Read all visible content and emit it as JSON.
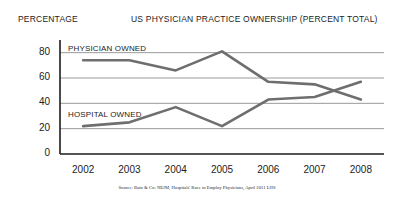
{
  "header": {
    "axis_label": "PERCENTAGE",
    "title": "US PHYSICIAN PRACTICE OWNERSHIP (PERCENT TOTAL)"
  },
  "source_note": "Source: Bain & Co; NEJM, Hospitals' Race to Employ Physicians, April 2011 LHS",
  "colors": {
    "line": "#6e6e6e",
    "gridline": "#9a9a9a",
    "axis": "#1c1c1c",
    "text": "#1c1c1c",
    "background": "#ffffff"
  },
  "chart_data": {
    "type": "line",
    "title": "US PHYSICIAN PRACTICE OWNERSHIP (PERCENT TOTAL)",
    "xlabel": "",
    "ylabel": "PERCENTAGE",
    "categories": [
      "2002",
      "2003",
      "2004",
      "2005",
      "2006",
      "2007",
      "2008"
    ],
    "x": [
      2002,
      2003,
      2004,
      2005,
      2006,
      2007,
      2008
    ],
    "ylim": [
      0,
      90
    ],
    "yticks": [
      0,
      20,
      40,
      60,
      80
    ],
    "ytick_labels": [
      "0",
      "20",
      "40",
      "60",
      "80"
    ],
    "grid": true,
    "gridlines_at": [
      20,
      40,
      60,
      80
    ],
    "legend": "inline-labels",
    "series": [
      {
        "name": "PHYSICIAN OWNED",
        "label": "PHYSICIAN OWNED",
        "values": [
          74,
          74,
          66,
          81,
          57,
          55,
          43
        ]
      },
      {
        "name": "HOSPITAL OWNED",
        "label": "HOSPITAL OWNED",
        "values": [
          22,
          25,
          37,
          22,
          43,
          45,
          57
        ]
      }
    ],
    "annotations": [
      "Source: Bain & Co; NEJM, Hospitals' Race to Employ Physicians, April 2011 LHS"
    ]
  }
}
